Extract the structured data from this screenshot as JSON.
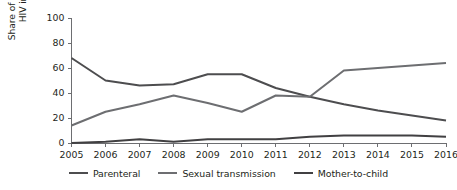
{
  "chart_data": {
    "type": "line",
    "title": "",
    "xlabel": "",
    "ylabel": "Share of newly diagnosed HIV infections (%)",
    "x": [
      2005,
      2006,
      2007,
      2008,
      2009,
      2010,
      2011,
      2012,
      2013,
      2014,
      2015,
      2016
    ],
    "xtick_labels": [
      "2005",
      "2006",
      "2007",
      "2008",
      "2009",
      "2010",
      "2011",
      "2012",
      "2013",
      "2014",
      "2015",
      "2016"
    ],
    "ytick_labels": [
      "0",
      "20",
      "40",
      "60",
      "80",
      "100"
    ],
    "yticks": [
      0,
      20,
      40,
      60,
      80,
      100
    ],
    "ylim": [
      0,
      100
    ],
    "xlim": [
      2005,
      2016
    ],
    "grid": false,
    "legend_position": "bottom",
    "series": [
      {
        "name": "Parenteral",
        "color": "#4d4d4f",
        "values": [
          68,
          50,
          46,
          47,
          55,
          55,
          44,
          37,
          31,
          26,
          22,
          18
        ]
      },
      {
        "name": "Sexual transmission",
        "color": "#6d6e71",
        "values": [
          14,
          25,
          31,
          38,
          32,
          25,
          38,
          37,
          58,
          60,
          62,
          64
        ]
      },
      {
        "name": "Mother-to-child",
        "color": "#414042",
        "values": [
          0,
          1,
          3,
          1,
          3,
          3,
          3,
          5,
          6,
          6,
          6,
          5
        ]
      }
    ]
  },
  "legend": {
    "items": [
      {
        "label": "Parenteral",
        "color": "#4d4d4f"
      },
      {
        "label": "Sexual transmission",
        "color": "#6d6e71"
      },
      {
        "label": "Mother-to-child",
        "color": "#414042"
      }
    ]
  }
}
